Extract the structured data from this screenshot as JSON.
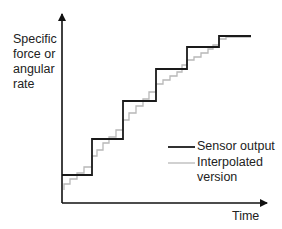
{
  "diagram": {
    "y_axis_label_lines": [
      "Specific",
      "force or",
      "angular",
      "rate"
    ],
    "x_axis_label": "Time",
    "legend": [
      {
        "label": "Sensor output",
        "color": "#1a1a1a",
        "style": "solid-thick"
      },
      {
        "label_lines": [
          "Interpolated",
          "version"
        ],
        "color": "#b8b8b8",
        "style": "solid-thin"
      }
    ],
    "colors": {
      "axis": "#111111",
      "sensor": "#1a1a1a",
      "interpolated": "#b8b8b8",
      "background": "#ffffff"
    },
    "axes": {
      "origin": [
        62,
        203
      ],
      "y_tip": [
        62,
        14
      ],
      "x_tip": [
        267,
        203
      ]
    },
    "sensor_steps": {
      "description": "Step-wise (zero-order hold) sensor output",
      "points": [
        [
          62,
          175
        ],
        [
          92,
          175
        ],
        [
          92,
          139
        ],
        [
          123,
          139
        ],
        [
          123,
          101
        ],
        [
          156,
          101
        ],
        [
          156,
          69
        ],
        [
          187,
          69
        ],
        [
          187,
          47
        ],
        [
          219,
          47
        ],
        [
          219,
          36
        ],
        [
          251,
          36
        ]
      ]
    },
    "interpolated_steps": {
      "description": "Finer interpolated staircase between sensor samples",
      "points": [
        [
          64,
          190
        ],
        [
          64,
          184
        ],
        [
          70,
          184
        ],
        [
          70,
          179
        ],
        [
          77,
          179
        ],
        [
          77,
          173
        ],
        [
          84,
          173
        ],
        [
          84,
          167
        ],
        [
          92,
          167
        ],
        [
          92,
          156
        ],
        [
          97,
          156
        ],
        [
          97,
          150
        ],
        [
          103,
          150
        ],
        [
          103,
          143
        ],
        [
          109,
          143
        ],
        [
          109,
          137
        ],
        [
          116,
          137
        ],
        [
          116,
          130
        ],
        [
          123,
          130
        ],
        [
          123,
          120
        ],
        [
          129,
          120
        ],
        [
          129,
          113
        ],
        [
          136,
          113
        ],
        [
          136,
          106
        ],
        [
          143,
          106
        ],
        [
          143,
          99
        ],
        [
          149,
          99
        ],
        [
          149,
          92
        ],
        [
          156,
          92
        ],
        [
          156,
          84
        ],
        [
          163,
          84
        ],
        [
          163,
          80
        ],
        [
          170,
          80
        ],
        [
          170,
          76
        ],
        [
          177,
          76
        ],
        [
          177,
          72
        ],
        [
          182,
          72
        ],
        [
          182,
          65
        ],
        [
          187,
          65
        ],
        [
          187,
          60
        ],
        [
          194,
          60
        ],
        [
          194,
          57
        ],
        [
          201,
          57
        ],
        [
          201,
          53
        ],
        [
          208,
          53
        ],
        [
          208,
          49
        ],
        [
          213,
          49
        ],
        [
          213,
          45
        ],
        [
          219,
          45
        ],
        [
          219,
          39
        ],
        [
          226,
          39
        ],
        [
          226,
          37
        ],
        [
          251,
          37
        ]
      ]
    }
  }
}
